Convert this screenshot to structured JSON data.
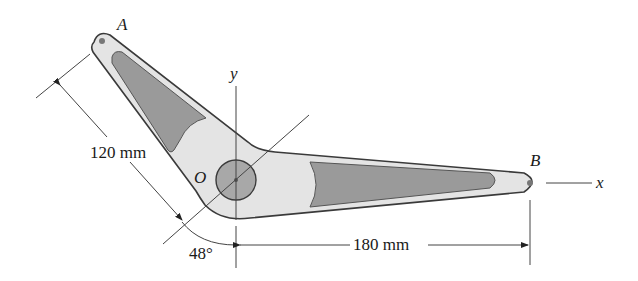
{
  "diagram": {
    "points": {
      "A": "A",
      "B": "B",
      "O": "O"
    },
    "axes": {
      "x": "x",
      "y": "y"
    },
    "dimensions": {
      "arm_OA_length": "120 mm",
      "arm_OB_length": "180 mm",
      "angle": "48°"
    },
    "colors": {
      "body": "#e4e4e4",
      "cutout": "#9a9a9a",
      "outline": "#3a3a3a",
      "hub": "#a8a8a8",
      "line": "#555555"
    }
  }
}
